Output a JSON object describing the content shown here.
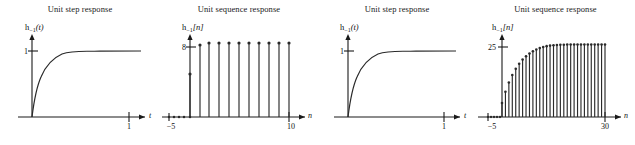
{
  "figure": {
    "background": "#ffffff",
    "ink": "#2a2a2a",
    "panel_count": 4
  },
  "panels": [
    {
      "id": "panel-1-unit-step",
      "title": "Unit step response",
      "ylabel_main": "h",
      "ylabel_sub": "−1",
      "ylabel_arg": "(t)",
      "ytick": "1",
      "xtick": "1",
      "xaxis_name": "t",
      "kind": "continuous"
    },
    {
      "id": "panel-2-unit-sequence",
      "title": "Unit sequence response",
      "ylabel_main": "h",
      "ylabel_sub": "−1",
      "ylabel_arg": "[n]",
      "ytick": "8",
      "xtick_left": "−5",
      "xtick_right": "10",
      "xaxis_name": "n",
      "kind": "discrete"
    },
    {
      "id": "panel-3-unit-step",
      "title": "Unit step response",
      "ylabel_main": "h",
      "ylabel_sub": "−1",
      "ylabel_arg": "(t)",
      "ytick": "1",
      "xtick": "1",
      "xaxis_name": "t",
      "kind": "continuous"
    },
    {
      "id": "panel-4-unit-sequence",
      "title": "Unit sequence response",
      "ylabel_main": "h",
      "ylabel_sub": "−1",
      "ylabel_arg": "[n]",
      "ytick": "25",
      "xtick_left": "−5",
      "xtick_right": "30",
      "xaxis_name": "n",
      "kind": "discrete"
    }
  ],
  "chart_data": [
    {
      "type": "line",
      "title": "Unit step response",
      "xlabel": "t",
      "ylabel": "h−1(t)",
      "xlim": [
        -0.12,
        1.28
      ],
      "ylim": [
        0,
        1.12
      ],
      "xticks": [
        1
      ],
      "xtick_labels": [
        "1"
      ],
      "yticks": [
        1
      ],
      "ytick_labels": [
        "1"
      ],
      "grid": false,
      "legend": "none",
      "x": [
        0,
        0.02,
        0.05,
        0.08,
        0.1,
        0.15,
        0.2,
        0.25,
        0.3,
        0.35,
        0.4,
        0.5,
        0.6,
        0.7,
        0.8,
        0.9,
        1.0,
        1.1,
        1.2,
        1.28
      ],
      "y": [
        0,
        0.181,
        0.393,
        0.551,
        0.632,
        0.777,
        0.865,
        0.918,
        0.95,
        0.97,
        0.982,
        0.993,
        0.998,
        0.999,
        1.0,
        1.0,
        1.0,
        1.0,
        1.0
      ]
    },
    {
      "type": "bar",
      "title": "Unit sequence response",
      "xlabel": "n",
      "ylabel": "h−1[n]",
      "xlim": [
        -6,
        11.5
      ],
      "ylim": [
        0,
        9.4
      ],
      "xticks": [
        -5,
        10
      ],
      "xtick_labels": [
        "−5",
        "10"
      ],
      "yticks": [
        8
      ],
      "ytick_labels": [
        "8"
      ],
      "grid": false,
      "legend": "none",
      "categories": [
        -5,
        -4,
        -3,
        -2,
        -1,
        0,
        1,
        2,
        3,
        4,
        5,
        6,
        7,
        8,
        9,
        10
      ],
      "values": [
        0,
        0,
        0,
        0,
        0,
        4.3,
        8.0,
        8.2,
        8.2,
        8.2,
        8.2,
        8.2,
        8.2,
        8.2,
        8.2,
        8.2
      ]
    },
    {
      "type": "line",
      "title": "Unit step response",
      "xlabel": "t",
      "ylabel": "h−1(t)",
      "xlim": [
        -0.12,
        1.28
      ],
      "ylim": [
        0,
        1.12
      ],
      "xticks": [
        1
      ],
      "xtick_labels": [
        "1"
      ],
      "yticks": [
        1
      ],
      "ytick_labels": [
        "1"
      ],
      "grid": false,
      "legend": "none",
      "x": [
        0,
        0.02,
        0.05,
        0.08,
        0.1,
        0.15,
        0.2,
        0.25,
        0.3,
        0.35,
        0.4,
        0.5,
        0.6,
        0.7,
        0.8,
        0.9,
        1.0,
        1.1,
        1.2,
        1.28
      ],
      "y": [
        0,
        0.181,
        0.393,
        0.551,
        0.632,
        0.777,
        0.865,
        0.918,
        0.95,
        0.97,
        0.982,
        0.993,
        0.998,
        0.999,
        1.0,
        1.0,
        1.0,
        1.0,
        1.0
      ]
    },
    {
      "type": "bar",
      "title": "Unit sequence response",
      "xlabel": "n",
      "ylabel": "h−1[n]",
      "xlim": [
        -6,
        33
      ],
      "ylim": [
        0,
        29
      ],
      "xticks": [
        -5,
        30
      ],
      "xtick_labels": [
        "−5",
        "30"
      ],
      "yticks": [
        25
      ],
      "ytick_labels": [
        "25"
      ],
      "grid": false,
      "legend": "none",
      "categories": [
        -5,
        -4,
        -3,
        -2,
        -1,
        0,
        1,
        2,
        3,
        4,
        5,
        6,
        7,
        8,
        9,
        10,
        11,
        12,
        13,
        14,
        15,
        16,
        17,
        18,
        19,
        20,
        21,
        22,
        23,
        24,
        25,
        26,
        27,
        28,
        29,
        30
      ],
      "values": [
        0,
        0,
        0,
        0,
        0,
        5.0,
        9.0,
        12.3,
        15.0,
        17.2,
        19.0,
        20.5,
        21.7,
        22.7,
        23.5,
        24.1,
        24.6,
        25.0,
        25.3,
        25.5,
        25.6,
        25.7,
        25.8,
        25.8,
        25.9,
        25.9,
        25.9,
        25.9,
        25.9,
        25.9,
        25.9,
        25.9,
        25.9,
        25.9,
        25.9,
        25.9
      ]
    }
  ]
}
